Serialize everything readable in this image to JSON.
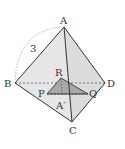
{
  "diagram": {
    "vertices": {
      "A": {
        "label": "A",
        "x": 64,
        "y": 27
      },
      "B": {
        "label": "B",
        "x": 15,
        "y": 83
      },
      "C": {
        "label": "C",
        "x": 72,
        "y": 122
      },
      "D": {
        "label": "D",
        "x": 105,
        "y": 83
      }
    },
    "section_points": {
      "R": {
        "label": "R",
        "x": 61,
        "y": 78
      },
      "P": {
        "label": "P",
        "x": 47,
        "y": 94
      },
      "Q": {
        "label": "Q",
        "x": 88,
        "y": 94
      },
      "A_prime": {
        "label": "A′",
        "x": 62,
        "y": 95
      }
    },
    "edge_length_label": "3",
    "colors": {
      "face": "#e4e4e4",
      "section": "#a8a8a8",
      "line": "#333333"
    }
  }
}
